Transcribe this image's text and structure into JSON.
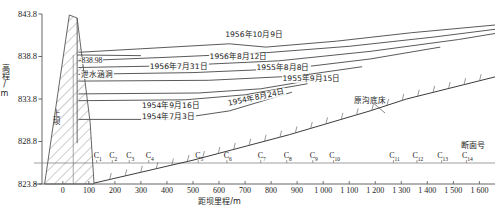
{
  "figure": {
    "type": "engineering-longitudinal-profile"
  },
  "axes": {
    "y": {
      "title": "高程/m",
      "ticks": [
        "843.8",
        "838.8",
        "833.8",
        "828.8",
        "823.8"
      ],
      "min": 823.8,
      "max": 843.8,
      "step": 5
    },
    "x": {
      "title": "距坝里程/m",
      "ticks": [
        "0",
        "100",
        "200",
        "300",
        "400",
        "500",
        "600",
        "700",
        "800",
        "900",
        "1 000",
        "1 100",
        "1 200",
        "1 300",
        "1 400",
        "1 500",
        "1 600"
      ],
      "min": -80,
      "max": 1660
    },
    "section_row_title": "断面号",
    "sections": [
      {
        "label": "C",
        "sub": "1",
        "x": 130
      },
      {
        "label": "C",
        "sub": "2",
        "x": 190
      },
      {
        "label": "C",
        "sub": "3",
        "x": 255
      },
      {
        "label": "C",
        "sub": "4",
        "x": 330
      },
      {
        "label": "C",
        "sub": "5",
        "x": 520
      },
      {
        "label": "C",
        "sub": "6",
        "x": 630
      },
      {
        "label": "C",
        "sub": "7",
        "x": 760
      },
      {
        "label": "C",
        "sub": "8",
        "x": 860
      },
      {
        "label": "C",
        "sub": "9",
        "x": 960
      },
      {
        "label": "C",
        "sub": "10",
        "x": 1040
      },
      {
        "label": "C",
        "sub": "11",
        "x": 1270
      },
      {
        "label": "C",
        "sub": "12",
        "x": 1360
      },
      {
        "label": "C",
        "sub": "13",
        "x": 1455
      },
      {
        "label": "C",
        "sub": "14",
        "x": 1550
      }
    ]
  },
  "annotations": {
    "dam_label": "上坝",
    "crest_elevation": "838.98",
    "culvert_label": "泄水涵洞",
    "original_bed_label": "原沟底床"
  },
  "chart_data": {
    "type": "line",
    "title": "",
    "xlabel": "距坝里程/m",
    "ylabel": "高程/m",
    "xlim": [
      -80,
      1660
    ],
    "ylim": [
      823.8,
      843.8
    ],
    "grid": false,
    "legend": "inline-labels",
    "series": [
      {
        "name": "1956年10月9日",
        "label": "1956年10月9日",
        "label_x": 620,
        "label_y": 841.2,
        "points": [
          [
            60,
            839.3
          ],
          [
            300,
            839.7
          ],
          [
            640,
            840.3
          ],
          [
            780,
            839.9
          ],
          [
            1050,
            840.6
          ],
          [
            1340,
            841.6
          ],
          [
            1660,
            842.5
          ]
        ]
      },
      {
        "name": "1956年8月12日",
        "label": "1956年8月12日",
        "label_x": 560,
        "label_y": 838.6,
        "points": [
          [
            60,
            838.3
          ],
          [
            400,
            838.7
          ],
          [
            760,
            839.2
          ],
          [
            1100,
            840.0
          ],
          [
            1430,
            841.1
          ],
          [
            1660,
            842.0
          ]
        ]
      },
      {
        "name": "1956年7月31日",
        "label": "1956年7月31日",
        "label_x": 330,
        "label_y": 837.4,
        "points": [
          [
            60,
            837.5
          ],
          [
            420,
            837.7
          ],
          [
            830,
            838.3
          ],
          [
            1180,
            839.4
          ],
          [
            1520,
            840.8
          ],
          [
            1660,
            841.5
          ]
        ]
      },
      {
        "name": "1955年8月8日",
        "label": "1955年8月8日",
        "label_x": 740,
        "label_y": 837.3,
        "points": [
          [
            60,
            836.7
          ],
          [
            500,
            836.9
          ],
          [
            880,
            837.4
          ],
          [
            1180,
            838.5
          ],
          [
            1450,
            839.9
          ]
        ]
      },
      {
        "name": "1955年9月15日",
        "label": "1955年9月15日",
        "label_x": 840,
        "label_y": 836.0,
        "points": [
          [
            60,
            835.9
          ],
          [
            560,
            836.0
          ],
          [
            900,
            836.5
          ],
          [
            1150,
            837.6
          ]
        ]
      },
      {
        "name": "1954年9月16日",
        "label": "1954年9月16日",
        "label_x": 300,
        "label_y": 832.9,
        "points": [
          [
            60,
            834.4
          ],
          [
            520,
            834.5
          ],
          [
            760,
            835.0
          ],
          [
            1010,
            836.3
          ]
        ]
      },
      {
        "name": "1954年8月24日",
        "label": "1954年8月24日",
        "label_x": 630,
        "label_y": 833.1,
        "points": [
          [
            60,
            833.6
          ],
          [
            470,
            833.7
          ],
          [
            700,
            834.3
          ],
          [
            940,
            835.6
          ]
        ]
      },
      {
        "name": "1954年7月3日",
        "label": "1954年7月3日",
        "label_x": 300,
        "label_y": 831.6,
        "points": [
          [
            60,
            831.4
          ],
          [
            420,
            831.4
          ],
          [
            640,
            832.4
          ],
          [
            880,
            834.6
          ]
        ]
      },
      {
        "name": "原沟底床",
        "label": "原沟底床",
        "label_x": 1090,
        "label_y": 834.2,
        "points": [
          [
            120,
            823.9
          ],
          [
            500,
            826.6
          ],
          [
            870,
            829.6
          ],
          [
            1180,
            832.4
          ],
          [
            1320,
            833.8
          ],
          [
            1660,
            836.4
          ]
        ]
      }
    ]
  }
}
